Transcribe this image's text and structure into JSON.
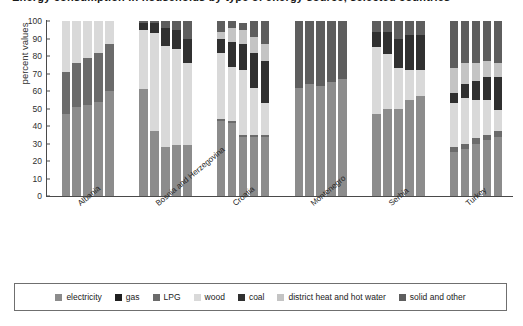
{
  "title": "Energy consumption in households by type of energy source, selected countries",
  "axes": {
    "ylabel": "percent values",
    "yticks": [
      0,
      10,
      20,
      30,
      40,
      50,
      60,
      70,
      80,
      90,
      100
    ],
    "ylim": [
      0,
      100
    ],
    "grid": false
  },
  "legend": {
    "position": "bottom",
    "items": [
      {
        "label": "electricity",
        "color": "#8c8c8c"
      },
      {
        "label": "gas",
        "color": "#1f1f1f"
      },
      {
        "label": "LPG",
        "color": "#6b6b6b"
      },
      {
        "label": "wood",
        "color": "#d9d9d9"
      },
      {
        "label": "coal",
        "color": "#303030"
      },
      {
        "label": "district heat and hot water",
        "color": "#c4c4c4"
      },
      {
        "label": "solid and other",
        "color": "#5e5e5e"
      }
    ]
  },
  "chart_data": {
    "type": "bar",
    "stacked": true,
    "title": "Energy consumption in households by type of energy source, selected countries",
    "xlabel": "",
    "ylabel": "percent values",
    "ylim": [
      0,
      100
    ],
    "categories": [
      "Albania",
      "Bosnia and Herzegovina",
      "Croatia",
      "Montenegro",
      "Serbia",
      "Turkey"
    ],
    "bars_per_category": 5,
    "series": [
      {
        "name": "electricity",
        "color": "#8c8c8c",
        "values": [
          [
            47,
            51,
            52,
            54,
            60
          ],
          [
            61,
            37,
            28,
            29,
            29
          ],
          [
            43,
            42,
            34,
            34,
            34
          ],
          [
            62,
            64,
            63,
            65,
            67
          ],
          [
            47,
            50,
            50,
            55,
            57
          ],
          [
            25,
            27,
            30,
            32,
            34
          ]
        ]
      },
      {
        "name": "gas",
        "color": "#1f1f1f",
        "values": [
          [
            0,
            0,
            0,
            0,
            0
          ],
          [
            0,
            0,
            0,
            0,
            0
          ],
          [
            0,
            0,
            0,
            0,
            0
          ],
          [
            0,
            0,
            0,
            0,
            0
          ],
          [
            0,
            0,
            0,
            0,
            0
          ],
          [
            0,
            0,
            0,
            0,
            0
          ]
        ]
      },
      {
        "name": "LPG",
        "color": "#6b6b6b",
        "values": [
          [
            24,
            25,
            27,
            28,
            27
          ],
          [
            0,
            0,
            0,
            0,
            0
          ],
          [
            1,
            1,
            1,
            1,
            1
          ],
          [
            0,
            0,
            0,
            0,
            0
          ],
          [
            0,
            0,
            0,
            0,
            0
          ],
          [
            3,
            3,
            3,
            3,
            3
          ]
        ]
      },
      {
        "name": "wood",
        "color": "#d9d9d9",
        "values": [
          [
            29,
            24,
            21,
            18,
            13
          ],
          [
            34,
            56,
            58,
            55,
            47
          ],
          [
            38,
            31,
            37,
            27,
            18
          ],
          [
            0,
            0,
            0,
            0,
            0
          ],
          [
            38,
            31,
            23,
            17,
            15
          ],
          [
            25,
            26,
            22,
            20,
            12
          ]
        ]
      },
      {
        "name": "coal",
        "color": "#303030",
        "values": [
          [
            0,
            0,
            0,
            0,
            0
          ],
          [
            4,
            6,
            10,
            11,
            14
          ],
          [
            8,
            14,
            15,
            20,
            24
          ],
          [
            0,
            0,
            0,
            0,
            0
          ],
          [
            9,
            13,
            17,
            20,
            20
          ],
          [
            6,
            8,
            11,
            13,
            19
          ]
        ]
      },
      {
        "name": "district heat and hot water",
        "color": "#c4c4c4",
        "values": [
          [
            0,
            0,
            0,
            0,
            0
          ],
          [
            0,
            0,
            0,
            0,
            0
          ],
          [
            4,
            8,
            8,
            9,
            10
          ],
          [
            0,
            0,
            0,
            0,
            0
          ],
          [
            0,
            0,
            0,
            0,
            0
          ],
          [
            14,
            12,
            10,
            9,
            8
          ]
        ]
      },
      {
        "name": "solid and other",
        "color": "#5e5e5e",
        "values": [
          [
            0,
            0,
            0,
            0,
            0
          ],
          [
            1,
            1,
            4,
            5,
            10
          ],
          [
            6,
            4,
            4,
            9,
            13
          ],
          [
            38,
            36,
            37,
            35,
            33
          ],
          [
            6,
            6,
            10,
            8,
            8
          ],
          [
            27,
            24,
            24,
            23,
            24
          ]
        ]
      }
    ]
  }
}
